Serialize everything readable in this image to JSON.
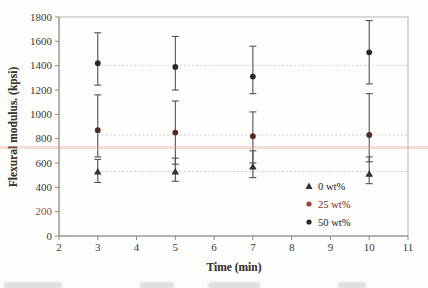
{
  "chart_data": {
    "type": "scatter",
    "title": "",
    "xlabel": "Time (min)",
    "ylabel": "Flexural modulus. (kpsi)",
    "xlim": [
      2,
      11
    ],
    "ylim": [
      0,
      1800
    ],
    "x_ticks": [
      2,
      3,
      4,
      5,
      6,
      7,
      8,
      9,
      10,
      11
    ],
    "y_ticks": [
      0,
      200,
      400,
      600,
      800,
      1000,
      1200,
      1400,
      1600,
      1800
    ],
    "y_tick_special": {
      "label": 200,
      "color": "#9b4a3a"
    },
    "grid": false,
    "legend_position": "inside-lower-right",
    "axis_frame_color": "#b6b3ab",
    "axis_line_color": "#8f8c84",
    "tick_text_color": "#3c3935",
    "error_bar_color": "#55524c",
    "series": [
      {
        "name": "0 wt%",
        "marker": "triangle",
        "marker_color": "#35312c",
        "legend_text_color": "#3f3c38",
        "x": [
          3,
          5,
          7,
          10
        ],
        "y": [
          530,
          530,
          570,
          510
        ],
        "err_lo": [
          440,
          450,
          480,
          430
        ],
        "err_hi": [
          630,
          640,
          700,
          650
        ],
        "mean_ref_line": 530,
        "ref_line_color": "#d2bdb4"
      },
      {
        "name": "25 wt%",
        "marker": "circle",
        "marker_color": "#4f2b24",
        "legend_marker_color": "#9b4136",
        "legend_text_color": "#9b4136",
        "x": [
          3,
          5,
          7,
          10
        ],
        "y": [
          870,
          850,
          820,
          830
        ],
        "err_lo": [
          650,
          590,
          600,
          610
        ],
        "err_hi": [
          1160,
          1110,
          1020,
          1170
        ],
        "mean_ref_line": 830,
        "ref_line_color": "#c9c6be"
      },
      {
        "name": "50 wt%",
        "marker": "circle",
        "marker_color": "#2b2824",
        "legend_text_color": "#3f3c38",
        "x": [
          3,
          5,
          7,
          10
        ],
        "y": [
          1420,
          1390,
          1310,
          1510
        ],
        "err_lo": [
          1240,
          1200,
          1170,
          1250
        ],
        "err_hi": [
          1670,
          1640,
          1560,
          1770
        ],
        "mean_ref_line": 1400,
        "ref_line_color": "#c9c6be"
      }
    ],
    "ref_line_dash": "1.5 2.6",
    "ref_line_start_x": 3
  }
}
